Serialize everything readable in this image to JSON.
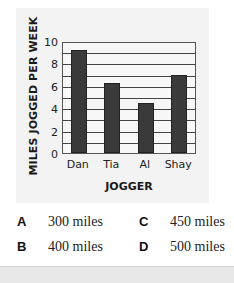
{
  "chart_data": {
    "type": "bar",
    "title": "",
    "xlabel": "JOGGER",
    "ylabel": "MILES JOGGED PER WEEK",
    "categories": [
      "Dan",
      "Tia",
      "Al",
      "Shay"
    ],
    "values": [
      9.2,
      6.25,
      4.5,
      7
    ],
    "ylim": [
      0,
      10
    ],
    "yticks": [
      0,
      2,
      4,
      6,
      8,
      10
    ],
    "yticks_labels": [
      "0",
      "2",
      "4",
      "6",
      "8",
      "10"
    ],
    "gridlines_every": 1,
    "grid": true,
    "bar_color": "#3a3a3a",
    "legend": null
  },
  "answer_choices": [
    {
      "letter": "A",
      "text": "300 miles"
    },
    {
      "letter": "B",
      "text": "400 miles"
    },
    {
      "letter": "C",
      "text": "450 miles"
    },
    {
      "letter": "D",
      "text": "500 miles"
    }
  ]
}
